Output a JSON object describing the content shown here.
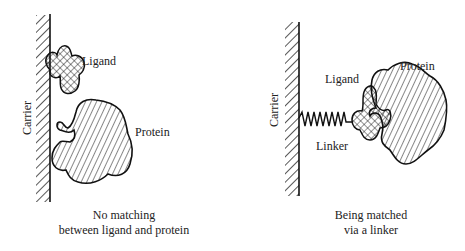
{
  "panels": [
    {
      "id": "left",
      "labels": {
        "carrier": "Carrier",
        "ligand": "Ligand",
        "protein": "Protein"
      },
      "caption": {
        "line1": "No matching",
        "line2": "between ligand and protein"
      }
    },
    {
      "id": "right",
      "labels": {
        "carrier": "Carrier",
        "ligand": "Ligand",
        "protein": "Protein",
        "linker": "Linker"
      },
      "caption": {
        "line1": "Being matched",
        "line2": "via a linker"
      }
    }
  ],
  "colors": {
    "stroke": "#111111",
    "background": "#ffffff",
    "text": "#222222"
  }
}
